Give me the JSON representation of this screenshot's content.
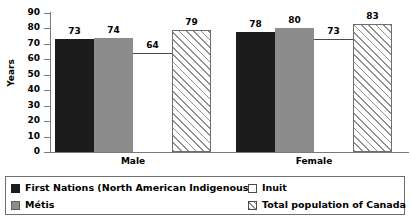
{
  "chart_data": {
    "type": "bar",
    "title": "",
    "xlabel": "",
    "ylabel": "Years",
    "ylim": [
      0,
      90
    ],
    "ytick_step": 10,
    "yticks": [
      "90",
      "80",
      "70",
      "60",
      "50",
      "40",
      "30",
      "20",
      "10",
      "0"
    ],
    "grid": false,
    "legend_position": "bottom",
    "categories": [
      "Male",
      "Female"
    ],
    "series": [
      {
        "name": "First Nations (North American Indigenous)",
        "style": "black",
        "values": [
          73,
          78
        ]
      },
      {
        "name": "Métis",
        "style": "gray",
        "values": [
          74,
          80
        ]
      },
      {
        "name": "Inuit",
        "style": "white",
        "values": [
          64,
          73
        ]
      },
      {
        "name": "Total population of Canada",
        "style": "hatch",
        "values": [
          79,
          83
        ]
      }
    ]
  },
  "legend": {
    "items": [
      {
        "label": "First Nations (North American Indigenous)",
        "style": "black"
      },
      {
        "label": "Métis",
        "style": "gray"
      },
      {
        "label": "Inuit",
        "style": "white"
      },
      {
        "label": "Total population of Canada",
        "style": "hatch"
      }
    ]
  }
}
